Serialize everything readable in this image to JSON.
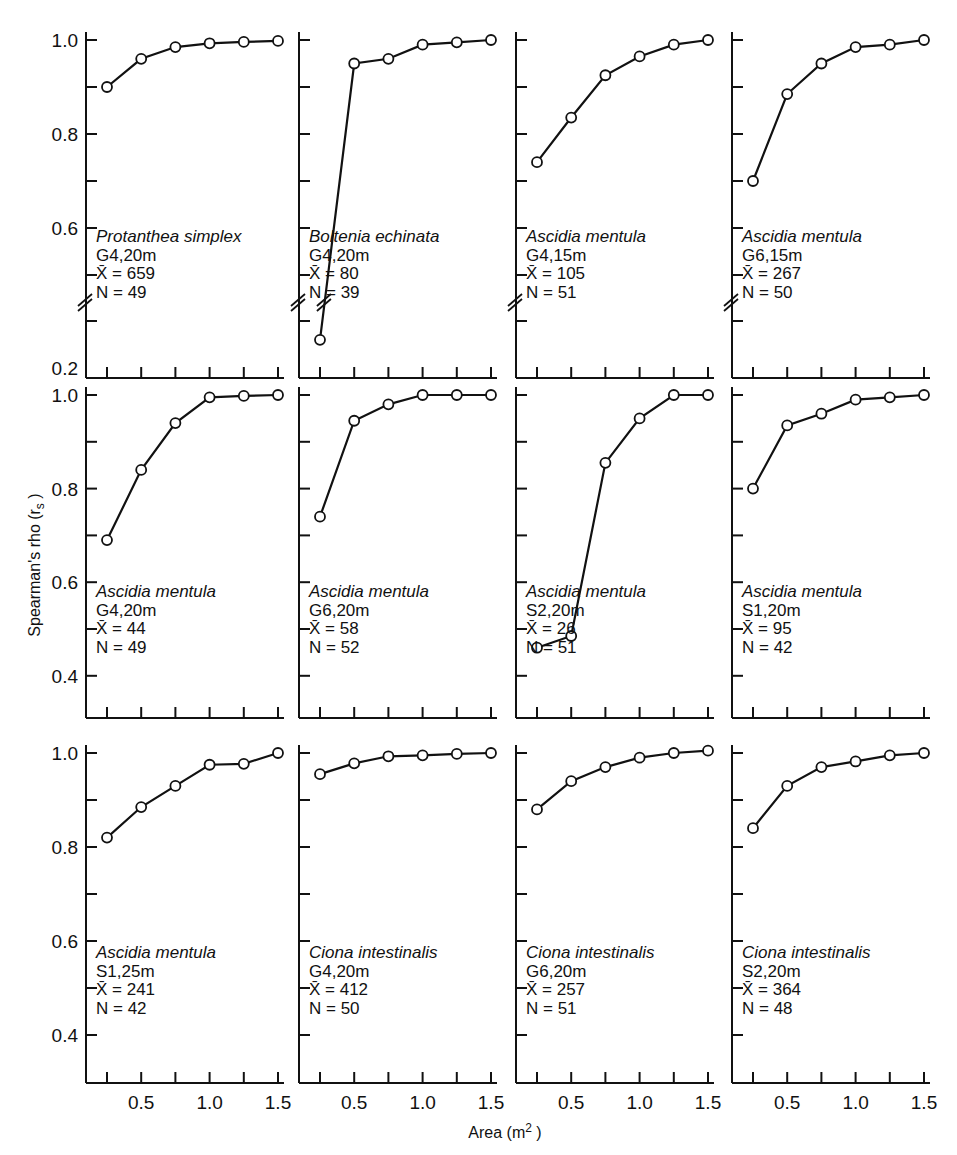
{
  "figure": {
    "ylabel": "Spearman's rho (r",
    "ylabel_sub": "s",
    "ylabel_close": ")",
    "xlabel": "Area (m",
    "xlabel_sup": "2",
    "xlabel_close": ")"
  },
  "chart_data": {
    "type": "line",
    "layout": "3x4 small multiples",
    "xlabel": "Area (m²)",
    "ylabel": "Spearman's rho (rₛ)",
    "x": [
      0.25,
      0.5,
      0.75,
      1.0,
      1.25,
      1.5
    ],
    "x_ticks": [
      0.25,
      0.5,
      0.75,
      1.0,
      1.25,
      1.5
    ],
    "x_tick_labels": [
      "0.5",
      "1.0",
      "1.5"
    ],
    "marker": "open circle",
    "grid": false,
    "rows": [
      {
        "ylim": [
          0.2,
          1.0
        ],
        "y_axis_break": true,
        "y_tick_labels": [
          "1.0",
          "0.8",
          "0.6",
          "0.2"
        ],
        "panels": [
          {
            "species": "Protanthea simplex",
            "site": "G4,20m",
            "mean_label": "X̄ = 659",
            "n_label": "N = 49",
            "values": [
              0.9,
              0.96,
              0.985,
              0.993,
              0.996,
              0.998
            ]
          },
          {
            "species": "Boltenia echinata",
            "site": "G4,20m",
            "mean_label": "X̄ = 80",
            "n_label": "N = 39",
            "values": [
              0.26,
              0.95,
              0.96,
              0.99,
              0.995,
              1.0
            ]
          },
          {
            "species": "Ascidia mentula",
            "site": "G4,15m",
            "mean_label": "X̄ = 105",
            "n_label": "N = 51",
            "values": [
              0.74,
              0.835,
              0.925,
              0.965,
              0.99,
              1.0
            ]
          },
          {
            "species": "Ascidia mentula",
            "site": "G6,15m",
            "mean_label": "X̄ = 267",
            "n_label": "N = 50",
            "values": [
              0.7,
              0.885,
              0.95,
              0.985,
              0.99,
              1.0
            ]
          }
        ]
      },
      {
        "ylim": [
          0.3,
          1.0
        ],
        "y_axis_break": false,
        "y_tick_labels": [
          "1.0",
          "0.8",
          "0.6",
          "0.4"
        ],
        "panels": [
          {
            "species": "Ascidia mentula",
            "site": "G4,20m",
            "mean_label": "X̄ = 44",
            "n_label": "N = 49",
            "values": [
              0.69,
              0.84,
              0.94,
              0.995,
              0.998,
              1.0
            ]
          },
          {
            "species": "Ascidia mentula",
            "site": "G6,20m",
            "mean_label": "X̄ = 58",
            "n_label": "N = 52",
            "values": [
              0.74,
              0.945,
              0.98,
              1.0,
              1.0,
              1.0
            ]
          },
          {
            "species": "Ascidia mentula",
            "site": "S2,20m",
            "mean_label": "X̄ = 26",
            "n_label": "N = 51",
            "values": [
              0.46,
              0.485,
              0.855,
              0.95,
              1.0,
              1.0
            ]
          },
          {
            "species": "Ascidia mentula",
            "site": "S1,20m",
            "mean_label": "X̄ = 95",
            "n_label": "N = 42",
            "values": [
              0.8,
              0.935,
              0.96,
              0.99,
              0.995,
              1.0
            ]
          }
        ]
      },
      {
        "ylim": [
          0.3,
          1.0
        ],
        "y_axis_break": false,
        "y_tick_labels": [
          "1.0",
          "0.8",
          "0.6",
          "0.4"
        ],
        "panels": [
          {
            "species": "Ascidia mentula",
            "site": "S1,25m",
            "mean_label": "X̄ = 241",
            "n_label": "N = 42",
            "values": [
              0.82,
              0.885,
              0.93,
              0.975,
              0.977,
              1.0
            ]
          },
          {
            "species": "Ciona intestinalis",
            "site": "G4,20m",
            "mean_label": "X̄ = 412",
            "n_label": "N = 50",
            "values": [
              0.955,
              0.978,
              0.993,
              0.995,
              0.998,
              1.0
            ]
          },
          {
            "species": "Ciona intestinalis",
            "site": "G6,20m",
            "mean_label": "X̄ = 257",
            "n_label": "N = 51",
            "values": [
              0.88,
              0.94,
              0.97,
              0.99,
              1.0,
              1.005
            ]
          },
          {
            "species": "Ciona intestinalis",
            "site": "S2,20m",
            "mean_label": "X̄ = 364",
            "n_label": "N = 48",
            "values": [
              0.84,
              0.93,
              0.97,
              0.982,
              0.995,
              1.0
            ]
          }
        ]
      }
    ]
  },
  "colors": {
    "ink": "#111111",
    "background": "#ffffff"
  }
}
